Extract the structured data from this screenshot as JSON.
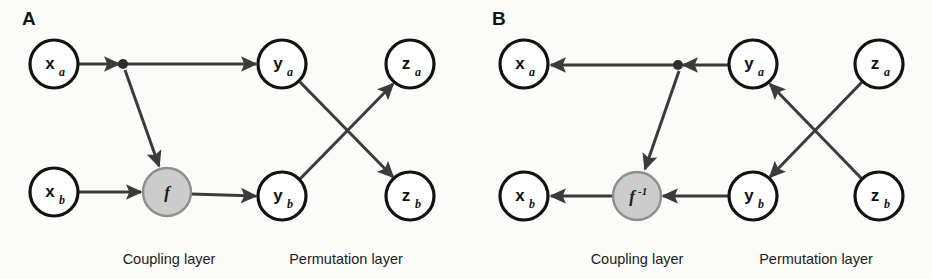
{
  "figure": {
    "width": 932,
    "height": 279,
    "background": "#fbfbfa",
    "edge_color": "#3b3b3b",
    "node_stroke": "#121212",
    "node_fill": "#ffffff",
    "function_fill": "#cccccc",
    "function_stroke": "#8e8e8e",
    "text_color": "#121212"
  },
  "panels": [
    {
      "id": "panel-a",
      "letter": "A",
      "letter_pos": {
        "x": 22,
        "y": 25
      },
      "direction": "forward",
      "nodes": [
        {
          "id": "xa",
          "base": "x",
          "sub": "a",
          "kind": "variable",
          "cx": 54,
          "cy": 64,
          "r": 24
        },
        {
          "id": "xb",
          "base": "x",
          "sub": "b",
          "kind": "variable",
          "cx": 54,
          "cy": 192,
          "r": 24
        },
        {
          "id": "f",
          "base": "f",
          "sup": "",
          "kind": "function",
          "cx": 167,
          "cy": 192,
          "r": 24
        },
        {
          "id": "ya",
          "base": "y",
          "sub": "a",
          "kind": "variable",
          "cx": 282,
          "cy": 64,
          "r": 24
        },
        {
          "id": "yb",
          "base": "y",
          "sub": "b",
          "kind": "variable",
          "cx": 282,
          "cy": 196,
          "r": 24
        },
        {
          "id": "za",
          "base": "z",
          "sub": "a",
          "kind": "variable",
          "cx": 410,
          "cy": 64,
          "r": 24
        },
        {
          "id": "zb",
          "base": "z",
          "sub": "b",
          "kind": "variable",
          "cx": 410,
          "cy": 196,
          "r": 24
        }
      ],
      "junction": {
        "id": "junction-a",
        "cx": 123,
        "cy": 64,
        "r": 5
      },
      "edges": [
        {
          "id": "xa-to-junction",
          "from": "xa",
          "to": "junction",
          "x1": 78,
          "y1": 64,
          "x2": 119,
          "y2": 64,
          "arrow": true
        },
        {
          "id": "junction-to-ya",
          "from": "junction",
          "to": "ya",
          "x1": 127,
          "y1": 64,
          "x2": 256,
          "y2": 64,
          "arrow": true
        },
        {
          "id": "junction-to-f",
          "from": "junction",
          "to": "f",
          "x1": 125,
          "y1": 70,
          "x2": 159,
          "y2": 166,
          "arrow": true
        },
        {
          "id": "xb-to-f",
          "from": "xb",
          "to": "f",
          "x1": 78,
          "y1": 192,
          "x2": 141,
          "y2": 192,
          "arrow": true
        },
        {
          "id": "f-to-yb",
          "from": "f",
          "to": "yb",
          "x1": 191,
          "y1": 194,
          "x2": 256,
          "y2": 196,
          "arrow": true
        },
        {
          "id": "ya-to-zb",
          "from": "ya",
          "to": "zb",
          "x1": 300,
          "y1": 82,
          "x2": 393,
          "y2": 177,
          "arrow": true
        },
        {
          "id": "yb-to-za",
          "from": "yb",
          "to": "za",
          "x1": 300,
          "y1": 179,
          "x2": 393,
          "y2": 84,
          "arrow": true
        }
      ],
      "captions": [
        {
          "id": "caption-coupling-a",
          "text": "Coupling layer",
          "x": 169,
          "y": 264
        },
        {
          "id": "caption-permutation-a",
          "text": "Permutation layer",
          "x": 346,
          "y": 264
        }
      ]
    },
    {
      "id": "panel-b",
      "letter": "B",
      "letter_pos": {
        "x": 492,
        "y": 25
      },
      "direction": "inverse",
      "nodes": [
        {
          "id": "xa",
          "base": "x",
          "sub": "a",
          "kind": "variable",
          "cx": 524,
          "cy": 64,
          "r": 24
        },
        {
          "id": "xb",
          "base": "x",
          "sub": "b",
          "kind": "variable",
          "cx": 524,
          "cy": 196,
          "r": 24
        },
        {
          "id": "finv",
          "base": "f",
          "sup": "-1",
          "kind": "function",
          "cx": 637,
          "cy": 196,
          "r": 24
        },
        {
          "id": "ya",
          "base": "y",
          "sub": "a",
          "kind": "variable",
          "cx": 753,
          "cy": 64,
          "r": 24
        },
        {
          "id": "yb",
          "base": "y",
          "sub": "b",
          "kind": "variable",
          "cx": 753,
          "cy": 196,
          "r": 24
        },
        {
          "id": "za",
          "base": "z",
          "sub": "a",
          "kind": "variable",
          "cx": 879,
          "cy": 64,
          "r": 24
        },
        {
          "id": "zb",
          "base": "z",
          "sub": "b",
          "kind": "variable",
          "cx": 879,
          "cy": 196,
          "r": 24
        }
      ],
      "junction": {
        "id": "junction-b",
        "cx": 678,
        "cy": 65,
        "r": 5
      },
      "edges": [
        {
          "id": "junction-to-xa",
          "from": "junction",
          "to": "xa",
          "x1": 674,
          "y1": 65,
          "x2": 551,
          "y2": 65,
          "arrow": true
        },
        {
          "id": "ya-to-junction",
          "from": "ya",
          "to": "junction",
          "x1": 728,
          "y1": 65,
          "x2": 683,
          "y2": 65,
          "arrow": true
        },
        {
          "id": "junction-to-finv",
          "from": "junction",
          "to": "finv",
          "x1": 679,
          "y1": 71,
          "x2": 645,
          "y2": 169,
          "arrow": true
        },
        {
          "id": "yb-to-finv",
          "from": "yb",
          "to": "finv",
          "x1": 728,
          "y1": 196,
          "x2": 663,
          "y2": 196,
          "arrow": true
        },
        {
          "id": "finv-to-xb",
          "from": "finv",
          "to": "xb",
          "x1": 612,
          "y1": 196,
          "x2": 551,
          "y2": 196,
          "arrow": true
        },
        {
          "id": "za-to-yb",
          "from": "za",
          "to": "yb",
          "x1": 862,
          "y1": 82,
          "x2": 770,
          "y2": 177,
          "arrow": true
        },
        {
          "id": "zb-to-ya",
          "from": "zb",
          "to": "ya",
          "x1": 862,
          "y1": 179,
          "x2": 770,
          "y2": 84,
          "arrow": true
        }
      ],
      "captions": [
        {
          "id": "caption-coupling-b",
          "text": "Coupling layer",
          "x": 637,
          "y": 264
        },
        {
          "id": "caption-permutation-b",
          "text": "Permutation layer",
          "x": 816,
          "y": 264
        }
      ]
    }
  ],
  "chart_data": {
    "type": "diagram",
    "title": "",
    "panel_a_flow": [
      "x_a -> junction",
      "junction -> y_a",
      "junction -> f",
      "x_b -> f",
      "f -> y_b",
      "y_a -> z_b",
      "y_b -> z_a"
    ],
    "panel_b_flow": [
      "y_a -> junction",
      "junction -> x_a",
      "junction -> f^-1",
      "y_b -> f^-1",
      "f^-1 -> x_b",
      "z_a -> y_b",
      "z_b -> y_a"
    ],
    "layer_labels": [
      "Coupling layer",
      "Permutation layer"
    ]
  }
}
